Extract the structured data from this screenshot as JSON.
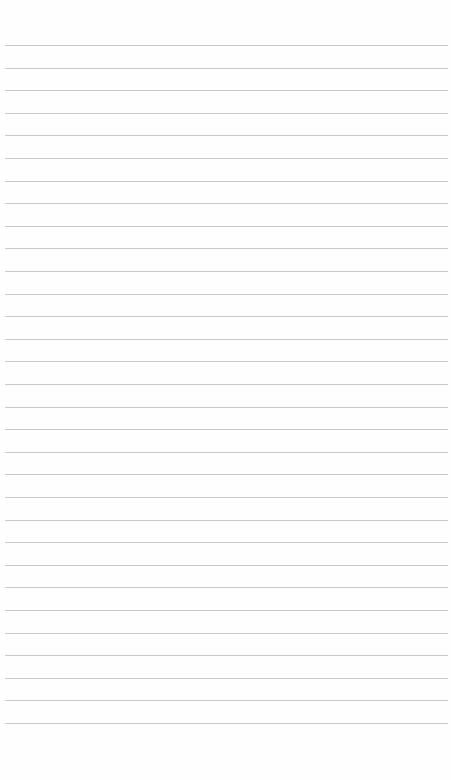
{
  "page": {
    "type": "lined-paper",
    "background_color": "#fefefe",
    "rule_color": "#c9c9c9",
    "rule_count": 31,
    "first_rule_y": 45,
    "rule_spacing": 22.6,
    "rule_left": 5,
    "rule_width": 443,
    "text": ""
  }
}
